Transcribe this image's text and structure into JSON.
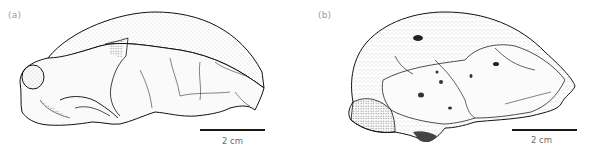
{
  "figure": {
    "panels": [
      {
        "label": "(a)",
        "scale_bar": {
          "text": "2 cm"
        }
      },
      {
        "label": "(b)",
        "scale_bar": {
          "text": "2 cm"
        }
      }
    ]
  },
  "colors": {
    "background": "#ffffff",
    "ink": "#1a1a1a",
    "label": "#9a9a9a",
    "scale_text": "#6a6a6a"
  }
}
